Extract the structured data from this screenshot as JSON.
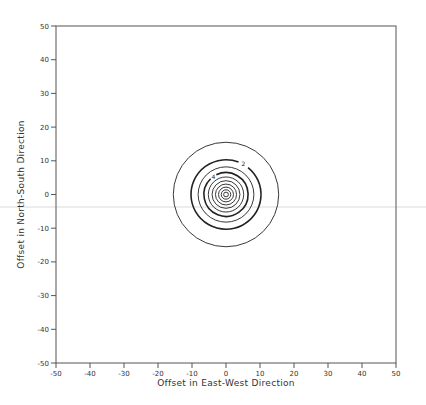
{
  "chart_data": {
    "type": "contour",
    "title": "",
    "xlabel": "Offset in East-West Direction",
    "ylabel": "Offset in North-South Direction",
    "xlim": [
      -50,
      50
    ],
    "ylim": [
      -50,
      50
    ],
    "x_ticks": [
      -50,
      -40,
      -30,
      -20,
      -10,
      0,
      10,
      20,
      30,
      40,
      50
    ],
    "y_ticks": [
      50,
      40,
      30,
      20,
      10,
      0,
      -10,
      -20,
      -30,
      -40,
      -50
    ],
    "grid": false,
    "center": [
      0,
      0
    ],
    "contours": [
      {
        "radius": 15.5,
        "label": "",
        "bold": false
      },
      {
        "radius": 10.3,
        "label": "2",
        "bold": true
      },
      {
        "radius": 8.2,
        "label": "",
        "bold": false
      },
      {
        "radius": 6.5,
        "label": "4",
        "bold": true
      },
      {
        "radius": 5.2,
        "label": "",
        "bold": false
      },
      {
        "radius": 4.1,
        "label": "",
        "bold": false
      },
      {
        "radius": 3.1,
        "label": "",
        "bold": false
      },
      {
        "radius": 2.2,
        "label": "",
        "bold": false
      },
      {
        "radius": 1.4,
        "label": "",
        "bold": false
      },
      {
        "radius": 0.7,
        "label": "",
        "bold": false
      }
    ],
    "contour_labels_visible": [
      "2",
      "4"
    ]
  },
  "colors": {
    "axis": "#555555",
    "contour": "#222222",
    "stray_line": "#d8d8d8"
  }
}
